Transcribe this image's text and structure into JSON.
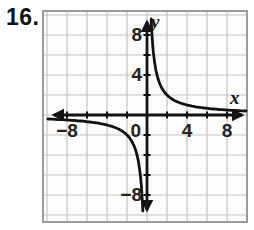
{
  "problem": {
    "number": "16."
  },
  "graph": {
    "labels": {
      "y_axis": "y",
      "x_axis": "x",
      "y_tick_8": "8",
      "y_tick_4": "4",
      "y_tick_neg8": "−8",
      "x_tick_neg8": "−8",
      "origin": "0",
      "x_tick_4": "4",
      "x_tick_8": "8"
    },
    "colors": {
      "background": "#fdfdfb",
      "grid": "#c4c4c8",
      "border": "#9b9b9b",
      "axis": "#141414",
      "curve": "#121212",
      "label": "#222222"
    }
  },
  "chart_data": {
    "type": "line",
    "title": "",
    "xlabel": "x",
    "ylabel": "y",
    "xlim": [
      -10,
      10
    ],
    "ylim": [
      -10,
      10
    ],
    "grid": true,
    "grid_step": 2,
    "tick_step": 2,
    "labeled_x_ticks": [
      -8,
      0,
      4,
      8
    ],
    "labeled_y_ticks": [
      -8,
      4,
      8
    ],
    "curve_family": "reciprocal y = k/x",
    "k": 4,
    "asymptotes": {
      "vertical_x": 0,
      "horizontal_y": 0
    },
    "series": [
      {
        "name": "quadrant-1-branch",
        "points": [
          [
            0.5,
            8
          ],
          [
            1,
            4
          ],
          [
            2,
            2
          ],
          [
            4,
            1
          ],
          [
            8,
            0.5
          ]
        ]
      },
      {
        "name": "quadrant-3-branch",
        "points": [
          [
            -0.5,
            -8
          ],
          [
            -1,
            -4
          ],
          [
            -2,
            -2
          ],
          [
            -4,
            -1
          ],
          [
            -8,
            -0.5
          ]
        ]
      }
    ]
  }
}
